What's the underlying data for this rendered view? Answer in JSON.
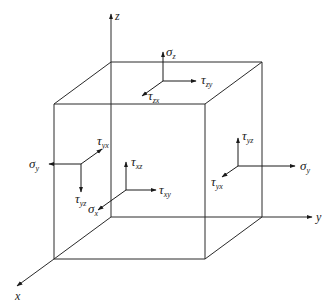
{
  "figure": {
    "axes": {
      "x": "x",
      "y": "y",
      "z": "z"
    },
    "faces": {
      "top": {
        "normal": {
          "symbol": "σ",
          "subscript": "z"
        },
        "shear_1": {
          "symbol": "τ",
          "subscript": "zy"
        },
        "shear_2": {
          "symbol": "τ",
          "subscript": "zx"
        }
      },
      "left": {
        "normal": {
          "symbol": "σ",
          "subscript": "y"
        },
        "shear_1": {
          "symbol": "τ",
          "subscript": "yx"
        },
        "shear_2": {
          "symbol": "τ",
          "subscript": "yz"
        }
      },
      "front": {
        "normal": {
          "symbol": "σ",
          "subscript": "x"
        },
        "shear_1": {
          "symbol": "τ",
          "subscript": "xz"
        },
        "shear_2": {
          "symbol": "τ",
          "subscript": "xy"
        }
      },
      "right": {
        "normal": {
          "symbol": "σ",
          "subscript": "y"
        },
        "shear_1": {
          "symbol": "τ",
          "subscript": "yz"
        },
        "shear_2": {
          "symbol": "τ",
          "subscript": "yx"
        }
      }
    },
    "colors": {
      "line": "#2a2a2a",
      "text": "#222222",
      "background": "#ffffff"
    }
  }
}
